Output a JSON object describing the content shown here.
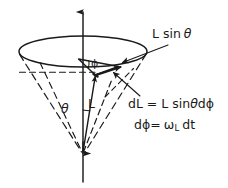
{
  "figure": {
    "background_color": "#ffffff",
    "ink_color": "#1a1a1a",
    "width": 228,
    "height": 188,
    "labels": {
      "l_sin_theta": "L sin",
      "l_sin_theta_symbol": "θ",
      "dl_lhs": "dL = L sin",
      "dl_theta": "θ",
      "dl_rhs": "d",
      "dl_phi": "ϕ",
      "dphi_lhs": "d",
      "dphi_symbol": "ϕ",
      "dphi_eq": "=",
      "dphi_omega": "ω",
      "dphi_omega_sub": "L",
      "dphi_dt": "dt",
      "theta_angle": "θ",
      "angular_momentum": "L",
      "phi_angle": "ϕ"
    },
    "equations": [
      "dL = L sinθ dϕ",
      "dϕ = ω_L dt"
    ],
    "elements": {
      "vertical_axis": "precession-axis-arrow",
      "ellipse": "precession-circle",
      "cone": "precession-cone",
      "dl_vector": "dl-vector-arrow",
      "l_vector": "angular-momentum-vector",
      "theta_arc": "theta-angle-arc",
      "phi_arc": "phi-angle-arc",
      "radius_dashed": "radius-dashed-line",
      "leader_lsintheta": "leader-line-l-sin-theta",
      "leader_dl": "leader-line-dl"
    }
  }
}
